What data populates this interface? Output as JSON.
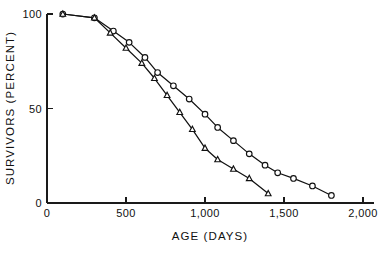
{
  "chart_data": {
    "type": "line",
    "title": "",
    "xlabel": "AGE  (DAYS)",
    "ylabel": "SURVIVORS  (PERCENT)",
    "xlim": [
      0,
      2000
    ],
    "ylim": [
      0,
      100
    ],
    "xticks": [
      0,
      500,
      1000,
      1500,
      2000
    ],
    "xticklabels": [
      "0",
      "500",
      "1,000",
      "1,500",
      "2,000"
    ],
    "yticks": [
      0,
      50,
      100
    ],
    "yticklabels": [
      "0",
      "50",
      "100"
    ],
    "grid": false,
    "legend": null,
    "legend_position": "none",
    "marker_colors": {
      "line": "#111111",
      "marker_face": "#ffffff",
      "marker_edge": "#111111"
    },
    "series": [
      {
        "name": "circle-series",
        "marker": "circle",
        "x": [
          100,
          300,
          420,
          520,
          620,
          700,
          800,
          900,
          1000,
          1080,
          1180,
          1280,
          1380,
          1460,
          1560,
          1680,
          1800
        ],
        "y": [
          100,
          98,
          91,
          85,
          77,
          69,
          62,
          55,
          47,
          40,
          33,
          26,
          20,
          16,
          13,
          9,
          4
        ]
      },
      {
        "name": "triangle-series",
        "marker": "triangle",
        "x": [
          100,
          300,
          400,
          500,
          600,
          680,
          760,
          840,
          920,
          1000,
          1080,
          1180,
          1280,
          1400
        ],
        "y": [
          100,
          98,
          90,
          82,
          74,
          66,
          57,
          48,
          39,
          29,
          23,
          18,
          13,
          5
        ]
      }
    ]
  },
  "axes": {
    "x_axis_name": "age-days-axis",
    "y_axis_name": "survivors-percent-axis"
  }
}
